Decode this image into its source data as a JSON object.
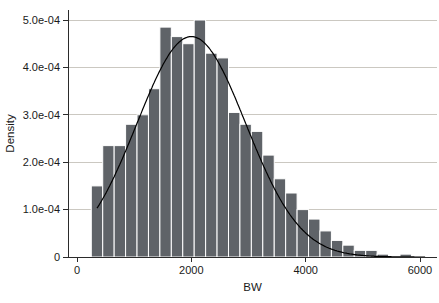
{
  "figure": {
    "width": 439,
    "height": 303,
    "background": "#ffffff"
  },
  "chart_data": {
    "type": "bar",
    "subtype": "histogram_with_normal_density_overlay",
    "title": "",
    "xlabel": "BW",
    "ylabel": "Density",
    "x_ticks": [
      {
        "value": 0,
        "label": "0"
      },
      {
        "value": 2000,
        "label": "2000"
      },
      {
        "value": 4000,
        "label": "4000"
      },
      {
        "value": 6000,
        "label": "6000"
      }
    ],
    "y_ticks": [
      {
        "value": 0.0,
        "label": "0"
      },
      {
        "value": 1.0,
        "label": "1.0e-04"
      },
      {
        "value": 2.0,
        "label": "2.0e-04"
      },
      {
        "value": 3.0,
        "label": "3.0e-04"
      },
      {
        "value": 4.0,
        "label": "4.0e-04"
      },
      {
        "value": 5.0,
        "label": "5.0e-04"
      }
    ],
    "xlim": [
      0,
      6300
    ],
    "ylim_e4": [
      0,
      5.2
    ],
    "grid": "horizontal-only",
    "legend": "none",
    "bins": {
      "start": 250,
      "width": 200,
      "note": "densities in units of 1e-4",
      "densities_e4": [
        1.5,
        2.35,
        2.35,
        2.8,
        3.0,
        3.55,
        4.85,
        4.65,
        4.5,
        5.0,
        4.3,
        4.2,
        3.05,
        2.8,
        2.65,
        2.15,
        1.65,
        1.35,
        1.0,
        0.8,
        0.55,
        0.35,
        0.25,
        0.14,
        0.14,
        0.06,
        0,
        0.06
      ]
    },
    "normal_curve": {
      "mean": 2000,
      "sd": 950,
      "peak_e4": 4.65,
      "x_min": 350,
      "x_max": 6100
    },
    "colors": {
      "bar": "#5f6368",
      "bar_gap": "#ffffff",
      "grid": "#cbc8c1",
      "axis": "#2b2b2b",
      "curve": "#000000",
      "text": "#1a1a1a"
    }
  }
}
